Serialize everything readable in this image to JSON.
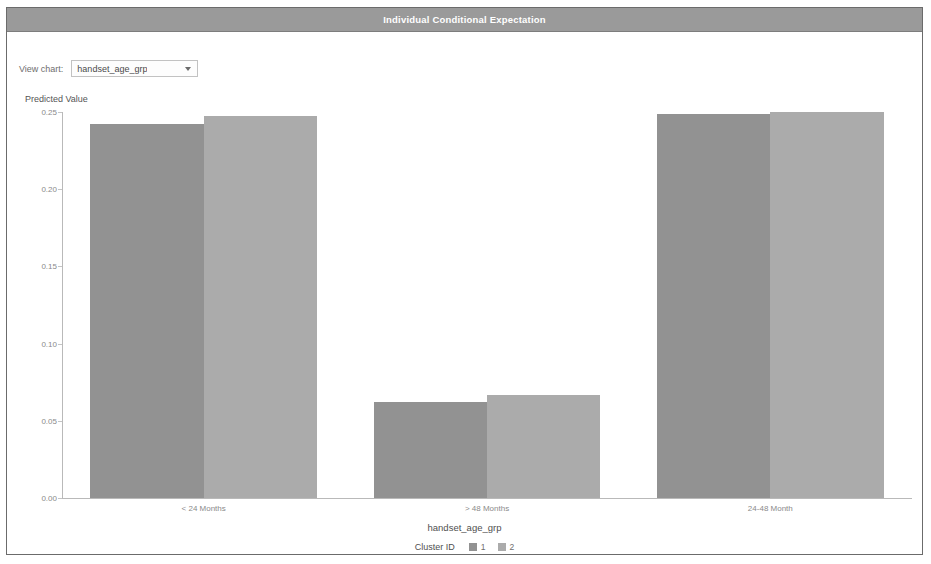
{
  "window": {
    "title": "Individual Conditional Expectation"
  },
  "toolbar": {
    "view_chart_label": "View chart:",
    "selected_chart": "handset_age_grp",
    "dropdown_arrow": "chevron-down-icon"
  },
  "colors": {
    "titlebar_bg": "#9a9a9a",
    "titlebar_text": "#ffffff",
    "cluster1": "#929292",
    "cluster2": "#ababab",
    "axis": "#b9b9b9",
    "tick_text": "#8a8a8a",
    "frame": "#6b6b6b"
  },
  "chart_data": {
    "type": "bar",
    "title": "Individual Conditional Expectation",
    "xlabel": "handset_age_grp",
    "ylabel": "Predicted Value",
    "categories": [
      "< 24 Months",
      "> 48 Months",
      "24-48 Month"
    ],
    "series": [
      {
        "name": "1",
        "values": [
          0.2425,
          0.0625,
          0.249
        ]
      },
      {
        "name": "2",
        "values": [
          0.2475,
          0.067,
          0.25
        ]
      }
    ],
    "ylim": [
      0.0,
      0.25
    ],
    "yticks": [
      0.0,
      0.05,
      0.1,
      0.15,
      0.2,
      0.25
    ],
    "ytick_labels": [
      "0.00",
      "0.05",
      "0.10",
      "0.15",
      "0.20",
      "0.25"
    ],
    "grid": false,
    "legend": {
      "title": "Cluster ID",
      "position": "bottom",
      "entries": [
        {
          "label": "1",
          "color": "#929292"
        },
        {
          "label": "2",
          "color": "#ababab"
        }
      ]
    }
  }
}
